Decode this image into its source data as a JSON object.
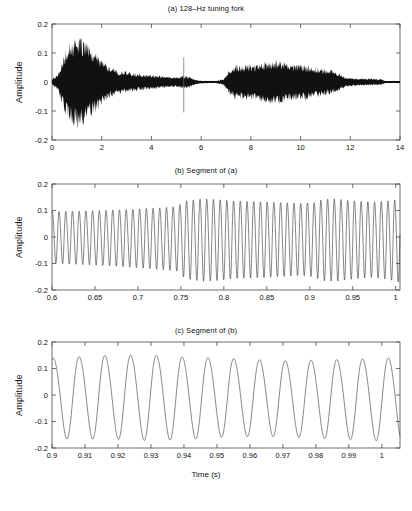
{
  "figure": {
    "background": "#ffffff",
    "ink_color": "#111111",
    "line_color": "#3b3b3b"
  },
  "panels": [
    {
      "id": "a",
      "title": "(a) 128–Hz tuning fork",
      "ylabel": "Amplitude",
      "xlabel": "",
      "ytick_labels": [
        "0.2",
        "0.1",
        "0",
        "-0.1",
        "-0.2"
      ],
      "xtick_labels": [
        "0",
        "2",
        "4",
        "6",
        "8",
        "10",
        "12",
        "14"
      ]
    },
    {
      "id": "b",
      "title": "(b) Segment of (a)",
      "ylabel": "Amplitude",
      "xlabel": "",
      "ytick_labels": [
        "0.2",
        "0.1",
        "0",
        "-0.1",
        "-0.2"
      ],
      "xtick_labels": [
        "0.6",
        "0.65",
        "0.7",
        "0.75",
        "0.8",
        "0.85",
        "0.9",
        "0.95",
        "1"
      ]
    },
    {
      "id": "c",
      "title": "(c) Segment of (b)",
      "ylabel": "Amplitude",
      "xlabel": "Time (s)",
      "ytick_labels": [
        "0.2",
        "0.1",
        "0",
        "-0.1",
        "-0.2"
      ],
      "xtick_labels": [
        "0.9",
        "0.91",
        "0.92",
        "0.93",
        "0.94",
        "0.95",
        "0.96",
        "0.97",
        "0.98",
        "0.99",
        "1"
      ]
    }
  ],
  "chart_data": [
    {
      "type": "line",
      "panel": "a",
      "title": "(a) 128–Hz tuning fork",
      "xlabel": "",
      "ylabel": "Amplitude",
      "xlim": [
        0,
        14
      ],
      "ylim": [
        -0.2,
        0.2
      ],
      "xticks": [
        0,
        2,
        4,
        6,
        8,
        10,
        12,
        14
      ],
      "yticks": [
        -0.2,
        -0.1,
        0,
        0.1,
        0.2
      ],
      "grid": false,
      "legend": "none",
      "description": "Full acoustic waveform of a 128-Hz tuning fork recording; dense oscillation rendered as a filled envelope. Two strikes: a large decaying burst starting near t=0.3 s peaking near t=1.1 s, and a second broader burst from about t=6.9 s to t=11.7 s. A narrow vertical transient spike appears near t=5.3 s.",
      "envelope_x": [
        0.0,
        0.25,
        0.4,
        0.55,
        0.7,
        0.85,
        1.0,
        1.1,
        1.25,
        1.45,
        1.65,
        1.85,
        2.05,
        2.3,
        2.6,
        2.9,
        3.2,
        3.5,
        3.8,
        4.1,
        4.4,
        4.7,
        5.0,
        5.2,
        5.35,
        5.55,
        5.75,
        6.0,
        6.3,
        6.6,
        6.9,
        7.1,
        7.35,
        7.6,
        7.9,
        8.2,
        8.5,
        8.8,
        9.05,
        9.3,
        9.6,
        9.9,
        10.2,
        10.5,
        10.8,
        11.05,
        11.3,
        11.55,
        11.75,
        12.0,
        12.4,
        12.9,
        13.25,
        13.4
      ],
      "envelope_upper": [
        0.012,
        0.03,
        0.075,
        0.115,
        0.14,
        0.152,
        0.158,
        0.16,
        0.15,
        0.13,
        0.112,
        0.095,
        0.075,
        0.055,
        0.042,
        0.038,
        0.035,
        0.03,
        0.027,
        0.024,
        0.021,
        0.019,
        0.017,
        0.02,
        0.022,
        0.018,
        0.009,
        0.005,
        0.004,
        0.004,
        0.01,
        0.038,
        0.062,
        0.058,
        0.066,
        0.062,
        0.07,
        0.078,
        0.08,
        0.072,
        0.066,
        0.062,
        0.06,
        0.055,
        0.05,
        0.046,
        0.04,
        0.03,
        0.02,
        0.014,
        0.013,
        0.012,
        0.011,
        0.004
      ],
      "envelope_lower": [
        -0.012,
        -0.03,
        -0.078,
        -0.118,
        -0.142,
        -0.155,
        -0.16,
        -0.163,
        -0.152,
        -0.132,
        -0.114,
        -0.097,
        -0.076,
        -0.056,
        -0.043,
        -0.039,
        -0.036,
        -0.031,
        -0.028,
        -0.025,
        -0.022,
        -0.02,
        -0.018,
        -0.021,
        -0.023,
        -0.019,
        -0.01,
        -0.005,
        -0.004,
        -0.004,
        -0.011,
        -0.04,
        -0.064,
        -0.06,
        -0.068,
        -0.064,
        -0.072,
        -0.08,
        -0.082,
        -0.074,
        -0.068,
        -0.064,
        -0.062,
        -0.057,
        -0.052,
        -0.047,
        -0.041,
        -0.031,
        -0.021,
        -0.015,
        -0.013,
        -0.012,
        -0.011,
        -0.004
      ],
      "transient_spike": {
        "x": 5.3,
        "ymin": -0.105,
        "ymax": 0.085
      }
    },
    {
      "type": "line",
      "panel": "b",
      "title": "(b) Segment of (a)",
      "xlabel": "",
      "ylabel": "Amplitude",
      "xlim": [
        0.6,
        1.005
      ],
      "ylim": [
        -0.2,
        0.2
      ],
      "xticks": [
        0.6,
        0.65,
        0.7,
        0.75,
        0.8,
        0.85,
        0.9,
        0.95,
        1.0
      ],
      "yticks": [
        -0.2,
        -0.1,
        0,
        0.1,
        0.2
      ],
      "grid": false,
      "legend": "none",
      "frequency_hz": 128,
      "description": "Zoom of panel (a) from 0.6 s to 1.0 s showing about 52 cycles of the 128-Hz tone. Amplitude grows from roughly 0.10 to 0.15, with a step-up in level near t=0.755 s and a second swell near t=0.915 s.",
      "envelope_x": [
        0.6,
        0.63,
        0.66,
        0.69,
        0.72,
        0.745,
        0.755,
        0.775,
        0.79,
        0.81,
        0.83,
        0.85,
        0.87,
        0.89,
        0.905,
        0.915,
        0.93,
        0.945,
        0.96,
        0.975,
        0.99,
        1.005
      ],
      "envelope_upper": [
        0.098,
        0.1,
        0.103,
        0.107,
        0.112,
        0.118,
        0.14,
        0.148,
        0.146,
        0.14,
        0.138,
        0.136,
        0.133,
        0.13,
        0.134,
        0.146,
        0.148,
        0.142,
        0.138,
        0.136,
        0.14,
        0.146
      ],
      "envelope_lower": [
        -0.096,
        -0.1,
        -0.104,
        -0.11,
        -0.117,
        -0.124,
        -0.152,
        -0.162,
        -0.16,
        -0.152,
        -0.15,
        -0.148,
        -0.144,
        -0.14,
        -0.146,
        -0.16,
        -0.162,
        -0.156,
        -0.15,
        -0.148,
        -0.154,
        -0.166
      ]
    },
    {
      "type": "line",
      "panel": "c",
      "title": "(c) Segment of (b)",
      "xlabel": "Time (s)",
      "ylabel": "Amplitude",
      "xlim": [
        0.9,
        1.0055
      ],
      "ylim": [
        -0.2,
        0.2
      ],
      "xticks": [
        0.9,
        0.91,
        0.92,
        0.93,
        0.94,
        0.95,
        0.96,
        0.97,
        0.98,
        0.99,
        1.0
      ],
      "yticks": [
        -0.2,
        -0.1,
        0,
        0.1,
        0.2
      ],
      "grid": false,
      "legend": "none",
      "frequency_hz": 128,
      "description": "Zoom of panel (b) from 0.9 s to about 1.005 s resolving roughly 13.5 individual sinusoidal cycles of the 128-Hz fundamental. Peaks sit near +0.15 and troughs near -0.17.",
      "envelope_x": [
        0.9,
        0.91,
        0.92,
        0.93,
        0.94,
        0.95,
        0.96,
        0.97,
        0.98,
        0.99,
        1.0,
        1.0055
      ],
      "envelope_upper": [
        0.143,
        0.15,
        0.155,
        0.155,
        0.147,
        0.144,
        0.138,
        0.133,
        0.136,
        0.138,
        0.143,
        0.145
      ],
      "envelope_lower": [
        -0.16,
        -0.16,
        -0.162,
        -0.167,
        -0.163,
        -0.155,
        -0.152,
        -0.152,
        -0.158,
        -0.163,
        -0.168,
        -0.17
      ]
    }
  ]
}
